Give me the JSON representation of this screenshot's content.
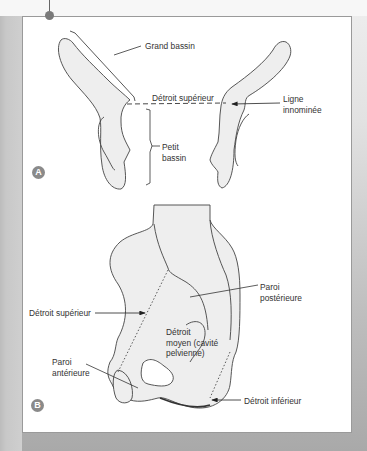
{
  "figure": {
    "header_cut_text": "...y...",
    "panel_a": {
      "badge": "A",
      "labels": {
        "grand_bassin": "Grand bassin",
        "detroit_superieur": "Détroit supérieur",
        "ligne_innominee": "Ligne\ninnominée",
        "petit_bassin": "Petit\nbassin"
      }
    },
    "panel_b": {
      "badge": "B",
      "labels": {
        "paroi_posterieure": "Paroi\npostérieure",
        "detroit_superieur": "Détroit supérieur",
        "detroit_moyen": "Détroit\nmoyen (cavité\npelvienne)",
        "paroi_anterieure": "Paroi\nantérieure",
        "detroit_inferieur": "Détroit inférieur"
      }
    },
    "colors": {
      "bone_fill": "#eeeeee",
      "outline": "#444444",
      "panel_bg": "#ffffff",
      "badge": "#8a8a8a"
    }
  }
}
